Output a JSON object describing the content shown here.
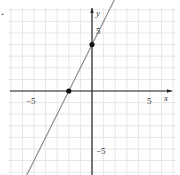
{
  "chart_data": {
    "type": "line",
    "title": "",
    "xlabel": "x",
    "ylabel": "y",
    "xlim": [
      -7.5,
      8.5
    ],
    "ylim": [
      -7,
      8
    ],
    "grid": true,
    "x_ticks_labeled": [
      -5,
      5
    ],
    "y_ticks_labeled": [
      -5,
      5
    ],
    "series": [
      {
        "name": "y = 2x + 4",
        "equation": "y = 2x + 4",
        "slope": 2,
        "intercept": 4,
        "color": "#888888"
      }
    ],
    "points": [
      {
        "x": -2,
        "y": 0,
        "label": "x-intercept"
      },
      {
        "x": 0,
        "y": 4,
        "label": "y-intercept"
      }
    ]
  },
  "labels": {
    "x_axis": "x",
    "y_axis": "y",
    "x_neg5": "−5",
    "x_pos5": "5",
    "y_pos5": "5",
    "y_neg5": "−5",
    "bullet": "."
  },
  "colors": {
    "grid": "#e6e6e6",
    "axis": "#222222",
    "line": "#888888",
    "point": "#111111"
  }
}
